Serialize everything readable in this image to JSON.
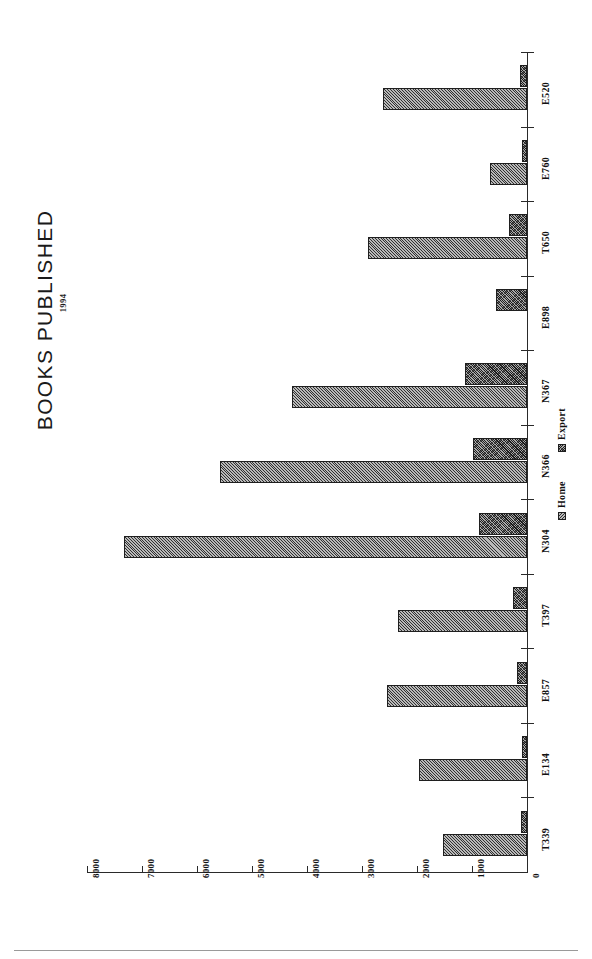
{
  "chart_data": {
    "type": "bar",
    "orientation": "horizontal",
    "title": "BOOKS  PUBLISHED",
    "subtitle": "1994",
    "xlabel": "",
    "ylabel": "",
    "grid": false,
    "legend_position": "inside-right",
    "categories": [
      "T339",
      "E134",
      "E857",
      "T397",
      "N304",
      "N366",
      "N367",
      "E898",
      "T650",
      "E760",
      "E520"
    ],
    "series": [
      {
        "name": "Home",
        "values": [
          1520,
          1970,
          2550,
          2350,
          7330,
          5580,
          4280,
          0,
          2900,
          670,
          2620
        ]
      },
      {
        "name": "Export",
        "values": [
          110,
          90,
          180,
          250,
          880,
          980,
          1130,
          560,
          330,
          100,
          130
        ]
      }
    ],
    "value_axis": {
      "ticks": [
        8000,
        7000,
        6000,
        5000,
        4000,
        3000,
        2000,
        1000,
        0
      ],
      "tick_labels": [
        "8000",
        "7000",
        "6000",
        "5000",
        "4000",
        "3000",
        "2000",
        "1000",
        "0"
      ],
      "min": 0,
      "max": 8000,
      "direction": "right-to-left"
    },
    "colors": {
      "home": "#b9b9b9",
      "export": "#a8a8a8",
      "outline": "#1f1f1f",
      "axis": "#2a2a2a",
      "text": "#111111",
      "background": "#ffffff"
    }
  }
}
